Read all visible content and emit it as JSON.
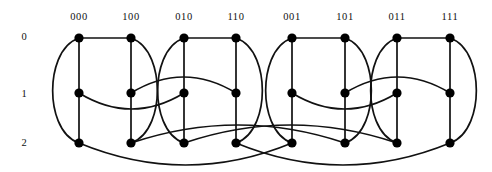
{
  "figure": {
    "type": "network-diagram",
    "name": "butterfly-network",
    "background_color": "#ffffff",
    "line_color": "#111111",
    "node_color": "#000000",
    "node_radius": 4.6,
    "edge_width": 1.7
  },
  "axes": {
    "column_label_y": 16,
    "row_label_x": 24,
    "column_labels": [
      {
        "text": "000",
        "x": 79
      },
      {
        "text": "100",
        "x": 131
      },
      {
        "text": "010",
        "x": 184
      },
      {
        "text": "110",
        "x": 236
      },
      {
        "text": "001",
        "x": 292
      },
      {
        "text": "101",
        "x": 345
      },
      {
        "text": "011",
        "x": 397
      },
      {
        "text": "111",
        "x": 450
      }
    ],
    "row_labels": [
      {
        "text": "0",
        "y": 36
      },
      {
        "text": "1",
        "y": 93
      },
      {
        "text": "2",
        "y": 142
      }
    ]
  },
  "geometry": {
    "columns_x": [
      79,
      131,
      184,
      236,
      292,
      345,
      397,
      450
    ],
    "rows_y": [
      38,
      93,
      143
    ]
  },
  "nodes": [
    {
      "id": "n0-0",
      "column": "000",
      "row": 0,
      "x": 79,
      "y": 38
    },
    {
      "id": "n0-1",
      "column": "100",
      "row": 0,
      "x": 131,
      "y": 38
    },
    {
      "id": "n0-2",
      "column": "010",
      "row": 0,
      "x": 184,
      "y": 38
    },
    {
      "id": "n0-3",
      "column": "110",
      "row": 0,
      "x": 236,
      "y": 38
    },
    {
      "id": "n0-4",
      "column": "001",
      "row": 0,
      "x": 292,
      "y": 38
    },
    {
      "id": "n0-5",
      "column": "101",
      "row": 0,
      "x": 345,
      "y": 38
    },
    {
      "id": "n0-6",
      "column": "011",
      "row": 0,
      "x": 397,
      "y": 38
    },
    {
      "id": "n0-7",
      "column": "111",
      "row": 0,
      "x": 450,
      "y": 38
    },
    {
      "id": "n1-0",
      "column": "000",
      "row": 1,
      "x": 79,
      "y": 93
    },
    {
      "id": "n1-1",
      "column": "100",
      "row": 1,
      "x": 131,
      "y": 93
    },
    {
      "id": "n1-2",
      "column": "010",
      "row": 1,
      "x": 184,
      "y": 93
    },
    {
      "id": "n1-3",
      "column": "110",
      "row": 1,
      "x": 236,
      "y": 93
    },
    {
      "id": "n1-4",
      "column": "001",
      "row": 1,
      "x": 292,
      "y": 93
    },
    {
      "id": "n1-5",
      "column": "101",
      "row": 1,
      "x": 345,
      "y": 93
    },
    {
      "id": "n1-6",
      "column": "011",
      "row": 1,
      "x": 397,
      "y": 93
    },
    {
      "id": "n1-7",
      "column": "111",
      "row": 1,
      "x": 450,
      "y": 93
    },
    {
      "id": "n2-0",
      "column": "000",
      "row": 2,
      "x": 79,
      "y": 143
    },
    {
      "id": "n2-1",
      "column": "100",
      "row": 2,
      "x": 131,
      "y": 143
    },
    {
      "id": "n2-2",
      "column": "010",
      "row": 2,
      "x": 184,
      "y": 143
    },
    {
      "id": "n2-3",
      "column": "110",
      "row": 2,
      "x": 236,
      "y": 143
    },
    {
      "id": "n2-4",
      "column": "001",
      "row": 2,
      "x": 292,
      "y": 143
    },
    {
      "id": "n2-5",
      "column": "101",
      "row": 2,
      "x": 345,
      "y": 143
    },
    {
      "id": "n2-6",
      "column": "011",
      "row": 2,
      "x": 397,
      "y": 143
    },
    {
      "id": "n2-7",
      "column": "111",
      "row": 2,
      "x": 450,
      "y": 143
    }
  ],
  "edges": {
    "vertical": [
      {
        "from": "n0-0",
        "to": "n2-0"
      },
      {
        "from": "n0-1",
        "to": "n2-1"
      },
      {
        "from": "n0-2",
        "to": "n2-2"
      },
      {
        "from": "n0-3",
        "to": "n2-3"
      },
      {
        "from": "n0-4",
        "to": "n2-4"
      },
      {
        "from": "n0-5",
        "to": "n2-5"
      },
      {
        "from": "n0-6",
        "to": "n2-6"
      },
      {
        "from": "n0-7",
        "to": "n2-7"
      }
    ],
    "row0_straight": [
      {
        "from": "n0-0",
        "to": "n0-1"
      },
      {
        "from": "n0-2",
        "to": "n0-3"
      },
      {
        "from": "n0-4",
        "to": "n0-5"
      },
      {
        "from": "n0-6",
        "to": "n0-7"
      }
    ],
    "block_outer_left_arcs": [
      {
        "from": "n0-0",
        "to": "n2-0",
        "bulge": -17
      },
      {
        "from": "n0-2",
        "to": "n2-2",
        "bulge": -17
      },
      {
        "from": "n0-4",
        "to": "n2-4",
        "bulge": -17
      },
      {
        "from": "n0-6",
        "to": "n2-6",
        "bulge": -17
      }
    ],
    "block_outer_right_arcs": [
      {
        "from": "n0-1",
        "to": "n2-1",
        "bulge": 17
      },
      {
        "from": "n0-3",
        "to": "n2-3",
        "bulge": 17
      },
      {
        "from": "n0-5",
        "to": "n2-5",
        "bulge": 17
      },
      {
        "from": "n0-7",
        "to": "n2-7",
        "bulge": 17
      }
    ],
    "row1_span2_arcs": [
      {
        "from": "n1-0",
        "to": "n1-2",
        "bulge": 16
      },
      {
        "from": "n1-1",
        "to": "n1-3",
        "bulge": -16
      },
      {
        "from": "n1-4",
        "to": "n1-6",
        "bulge": 16
      },
      {
        "from": "n1-5",
        "to": "n1-7",
        "bulge": -16
      }
    ],
    "row2_span4_arcs": [
      {
        "from": "n2-0",
        "to": "n2-4",
        "bulge": 22
      },
      {
        "from": "n2-1",
        "to": "n2-5",
        "bulge": -18
      },
      {
        "from": "n2-2",
        "to": "n2-6",
        "bulge": -18
      },
      {
        "from": "n2-3",
        "to": "n2-7",
        "bulge": 22
      }
    ]
  }
}
